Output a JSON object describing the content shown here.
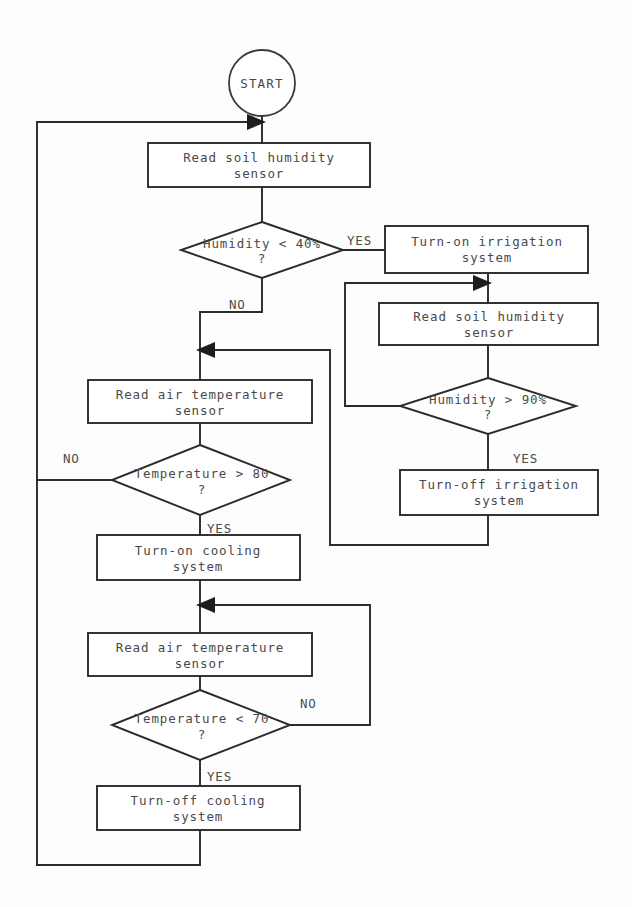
{
  "diagram": {
    "type": "flowchart",
    "background_color": "#fdfdfd",
    "line_color": "#2b2b2b",
    "text_color": "#4a4a4a",
    "nodes": {
      "start": {
        "id": "start",
        "shape": "circle",
        "label": "START"
      },
      "read_humidity_1": {
        "id": "read_humidity_1",
        "shape": "process",
        "line1": "Read soil humidity",
        "line2": "sensor"
      },
      "humidity_lt_40": {
        "id": "humidity_lt_40",
        "shape": "decision",
        "line1": "Humidity < 40%",
        "line2": "?"
      },
      "irrigation_on": {
        "id": "irrigation_on",
        "shape": "process",
        "line1": "Turn-on irrigation",
        "line2": "system"
      },
      "read_humidity_2": {
        "id": "read_humidity_2",
        "shape": "process",
        "line1": "Read soil humidity",
        "line2": "sensor"
      },
      "humidity_gt_90": {
        "id": "humidity_gt_90",
        "shape": "decision",
        "line1": "Humidity > 90%",
        "line2": "?"
      },
      "irrigation_off": {
        "id": "irrigation_off",
        "shape": "process",
        "line1": "Turn-off irrigation",
        "line2": "system"
      },
      "read_temp_1": {
        "id": "read_temp_1",
        "shape": "process",
        "line1": "Read air temperature",
        "line2": "sensor"
      },
      "temp_gt_80": {
        "id": "temp_gt_80",
        "shape": "decision",
        "line1": "Temperature > 80",
        "line2": "?"
      },
      "cooling_on": {
        "id": "cooling_on",
        "shape": "process",
        "line1": "Turn-on cooling",
        "line2": "system"
      },
      "read_temp_2": {
        "id": "read_temp_2",
        "shape": "process",
        "line1": "Read air temperature",
        "line2": "sensor"
      },
      "temp_lt_70": {
        "id": "temp_lt_70",
        "shape": "decision",
        "line1": "Temperature < 70",
        "line2": "?"
      },
      "cooling_off": {
        "id": "cooling_off",
        "shape": "process",
        "line1": "Turn-off cooling",
        "line2": "system"
      }
    },
    "edge_labels": {
      "humidity_lt_40_yes": "YES",
      "humidity_lt_40_no": "NO",
      "humidity_gt_90_yes": "YES",
      "temp_gt_80_no": "NO",
      "temp_gt_80_yes": "YES",
      "temp_lt_70_no": "NO",
      "temp_lt_70_yes": "YES"
    }
  }
}
